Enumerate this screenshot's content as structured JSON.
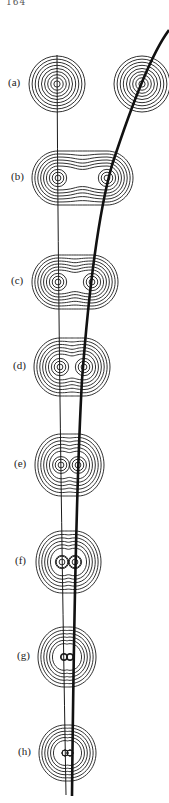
{
  "page": {
    "number": "164"
  },
  "figure": {
    "panels": [
      {
        "label": "(a)",
        "y": 84,
        "left_x": 57,
        "right_x": 142,
        "rx": 28,
        "ry": 28,
        "merged": false
      },
      {
        "label": "(b)",
        "y": 178,
        "left_x": 58,
        "right_x": 107,
        "rx": 26,
        "ry": 27,
        "merged": true
      },
      {
        "label": "(c)",
        "y": 282,
        "left_x": 58,
        "right_x": 92,
        "rx": 26,
        "ry": 27,
        "merged": true
      },
      {
        "label": "(d)",
        "y": 367,
        "left_x": 60,
        "right_x": 84,
        "rx": 26,
        "ry": 29,
        "merged": true
      },
      {
        "label": "(e)",
        "y": 465,
        "left_x": 61,
        "right_x": 78,
        "rx": 26,
        "ry": 31,
        "merged": true
      },
      {
        "label": "(f)",
        "y": 562,
        "left_x": 62,
        "right_x": 75,
        "rx": 26,
        "ry": 31,
        "merged": true
      },
      {
        "label": "(g)",
        "y": 657,
        "left_x": 64,
        "right_x": 70,
        "rx": 26,
        "ry": 30,
        "merged": true
      },
      {
        "label": "(h)",
        "y": 753,
        "left_x": 65,
        "right_x": 70,
        "rx": 26,
        "ry": 28,
        "merged": true
      }
    ],
    "ring_count": 9,
    "colors": {
      "line": "#1a1a1a",
      "background": "#ffffff"
    }
  }
}
